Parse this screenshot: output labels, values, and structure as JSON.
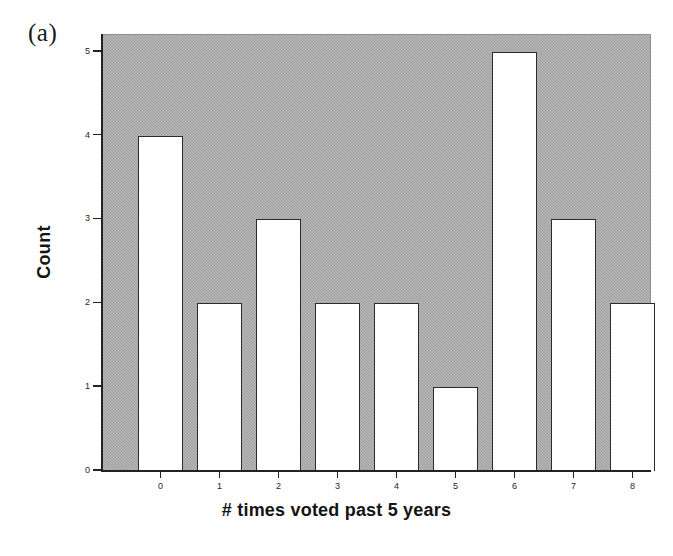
{
  "figure": {
    "panel_label": "(a)"
  },
  "chart_data": {
    "type": "bar",
    "title": "",
    "subtitle": "",
    "xlabel": "# times voted past 5 years",
    "ylabel": "Count",
    "categories": [
      "0",
      "1",
      "2",
      "3",
      "4",
      "5",
      "6",
      "7",
      "8"
    ],
    "values": [
      4,
      2,
      3,
      2,
      2,
      1,
      5,
      3,
      2
    ],
    "ylim": [
      0,
      5.2
    ],
    "y_ticks": [
      "0",
      "1",
      "2",
      "3",
      "4",
      "5"
    ],
    "y_tick_values": [
      0,
      1,
      2,
      3,
      4,
      5
    ],
    "x_ticks": [
      "0",
      "1",
      "2",
      "3",
      "4",
      "5",
      "6",
      "7",
      "8"
    ],
    "grid": false,
    "legend": null,
    "annotations": [
      "(a)"
    ],
    "colors": {
      "plot_background": "#a9a9a9",
      "bar_fill": "#ffffff",
      "bar_edge": "#2b2b2b",
      "axis": "#222222",
      "text": "#141414",
      "figure_background": "#ffffff"
    }
  }
}
